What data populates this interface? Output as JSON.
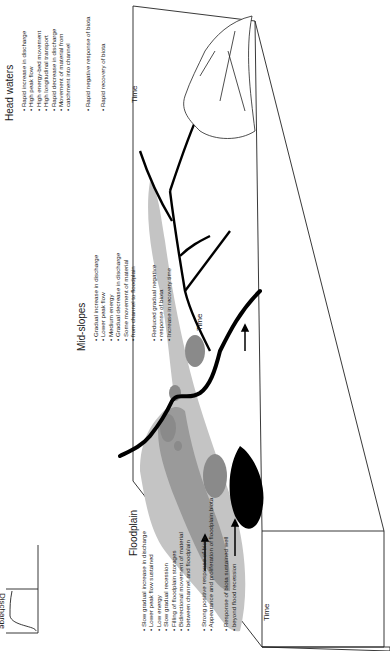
{
  "diagram": {
    "orientation": "rotated 90 degrees counter-clockwise (text reads bottom-to-top)",
    "sections": [
      {
        "id": "floodplain",
        "title": "Floodplain",
        "discharge_points": [
          "Slow gradual increase in discharge",
          "Lower peak flow sustained",
          "Low energy",
          "Slow gradual recession",
          "Filling of floodplain storages",
          "Bidirectional movement of material",
          "between channel and floodplain"
        ],
        "biota_points": [
          "Strong positive response of biota",
          "Appearance and proliferation of floodplain biota",
          "",
          "Response of biota sustained well",
          "beyond flood recession"
        ]
      },
      {
        "id": "mid-slopes",
        "title": "Mid-slopes",
        "discharge_points": [
          "Gradual increase in discharge",
          "Lower peak flow",
          "Medium energy",
          "Gradual decrease in discharge",
          "Some movement of material",
          "from channel to floodplain"
        ],
        "biota_points": [
          "Reduced gradual negative",
          "response of biota",
          "Increase in recovery time"
        ]
      },
      {
        "id": "head-waters",
        "title": "Head waters",
        "discharge_points": [
          "Rapid increase in discharge",
          "High peak flow",
          "High energy-bed movement",
          "High longitudinal transport",
          "Rapid decrease in discharge",
          "Movement of material from",
          "catchment into channel"
        ],
        "biota_points": [
          "Rapid negative response of biota",
          "",
          "Rapid recovery of biota"
        ]
      }
    ],
    "axis_labels": {
      "discharge": "Discharge",
      "biota": "Biota",
      "time": "Time"
    },
    "colors": {
      "channel": "#000000",
      "floodplain_light": "#bdbdbd",
      "floodplain_dark": "#8a8a8a",
      "outline": "#222222"
    }
  }
}
